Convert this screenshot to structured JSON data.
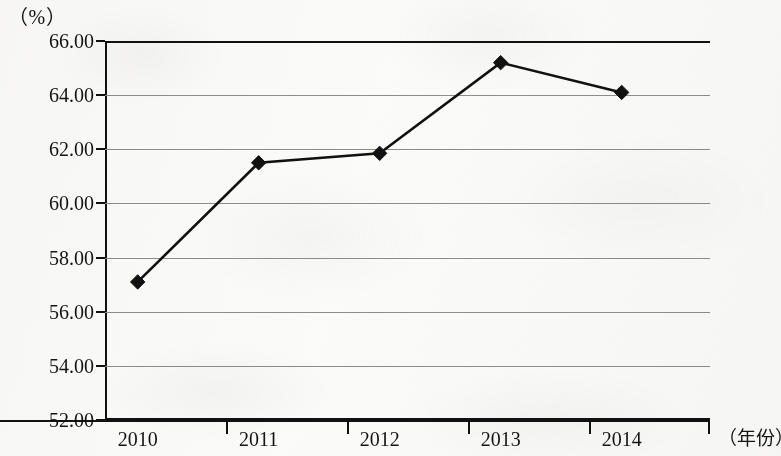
{
  "chart_data": {
    "type": "line",
    "title": "",
    "subtitle": "",
    "xlabel": "（年份）",
    "ylabel": "（%）",
    "categories": [
      "2010",
      "2011",
      "2012",
      "2013",
      "2014"
    ],
    "series": [
      {
        "name": "比重",
        "values": [
          57.1,
          61.5,
          61.85,
          65.2,
          64.1
        ]
      }
    ],
    "ylim": [
      52.0,
      66.0
    ],
    "ytick_step": 2.0,
    "ytick_labels": [
      "66.00",
      "64.00",
      "62.00",
      "60.00",
      "58.00",
      "56.00",
      "54.00",
      "52.00"
    ],
    "ytick_values": [
      66.0,
      64.0,
      62.0,
      60.0,
      58.0,
      56.0,
      54.0,
      52.0
    ],
    "xtick_labels": [
      "2010",
      "2011",
      "2012",
      "2013",
      "2014"
    ],
    "grid": "horizontal",
    "legend": "none",
    "marker": "diamond",
    "line_color": "#111111",
    "marker_color": "#111111",
    "grid_color": "#8d8d8d",
    "axis_color": "#111111",
    "background_color": "#fbfbfa"
  },
  "axes": {
    "y_unit_caption": "（%）",
    "x_unit_caption": "（年份）"
  }
}
